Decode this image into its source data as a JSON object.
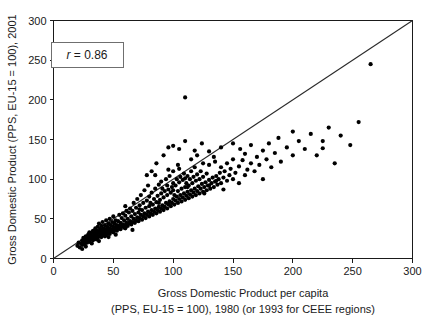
{
  "chart_data": {
    "type": "scatter",
    "title": "",
    "xlabel": "Gross Domestic Product per capita",
    "xlabel_line2": "(PPS, EU-15 = 100), 1980 (or 1993 for CEEE regions)",
    "ylabel": "Gross Domestic Product (PPS, EU-15 = 100), 2001",
    "xlim": [
      0,
      300
    ],
    "ylim": [
      0,
      300
    ],
    "xticks": [
      0,
      50,
      100,
      150,
      200,
      250,
      300
    ],
    "yticks": [
      0,
      50,
      100,
      150,
      200,
      250,
      300
    ],
    "xtick_labels": [
      "0",
      "50",
      "100",
      "150",
      "200",
      "250",
      "300"
    ],
    "ytick_labels": [
      "0",
      "50",
      "100",
      "150",
      "200",
      "250",
      "300"
    ],
    "grid": false,
    "legend_position": "none",
    "annotations": [
      {
        "name": "correlation-box",
        "symbol": "r",
        "operator": " = ",
        "value": "0.86",
        "text": "r = 0.86",
        "x": 28,
        "y": 257
      }
    ],
    "reference_line": {
      "name": "identity-line",
      "description": "45 degree y = x line",
      "x0": 0,
      "y0": 0,
      "x1": 300,
      "y1": 300
    },
    "marker": {
      "shape": "circle",
      "color": "#000000",
      "size_px": 2.1
    },
    "points": [
      [
        20,
        16
      ],
      [
        21,
        20
      ],
      [
        22,
        14
      ],
      [
        23,
        19
      ],
      [
        24,
        23
      ],
      [
        24,
        17
      ],
      [
        25,
        21
      ],
      [
        25,
        26
      ],
      [
        26,
        18
      ],
      [
        26,
        24
      ],
      [
        27,
        22
      ],
      [
        27,
        28
      ],
      [
        28,
        20
      ],
      [
        28,
        25
      ],
      [
        29,
        23
      ],
      [
        29,
        30
      ],
      [
        30,
        21
      ],
      [
        30,
        27
      ],
      [
        30,
        33
      ],
      [
        31,
        24
      ],
      [
        31,
        29
      ],
      [
        32,
        26
      ],
      [
        32,
        32
      ],
      [
        33,
        23
      ],
      [
        33,
        28
      ],
      [
        33,
        35
      ],
      [
        34,
        25
      ],
      [
        34,
        31
      ],
      [
        35,
        27
      ],
      [
        35,
        33
      ],
      [
        35,
        38
      ],
      [
        36,
        24
      ],
      [
        36,
        29
      ],
      [
        36,
        35
      ],
      [
        37,
        26
      ],
      [
        37,
        32
      ],
      [
        37,
        40
      ],
      [
        38,
        28
      ],
      [
        38,
        34
      ],
      [
        38,
        44
      ],
      [
        39,
        30
      ],
      [
        39,
        37
      ],
      [
        40,
        27
      ],
      [
        40,
        33
      ],
      [
        40,
        41
      ],
      [
        41,
        29
      ],
      [
        41,
        36
      ],
      [
        41,
        46
      ],
      [
        42,
        31
      ],
      [
        42,
        38
      ],
      [
        43,
        28
      ],
      [
        43,
        34
      ],
      [
        43,
        42
      ],
      [
        44,
        30
      ],
      [
        44,
        37
      ],
      [
        44,
        48
      ],
      [
        45,
        32
      ],
      [
        45,
        40
      ],
      [
        46,
        35
      ],
      [
        46,
        44
      ],
      [
        47,
        31
      ],
      [
        47,
        38
      ],
      [
        47,
        50
      ],
      [
        48,
        34
      ],
      [
        48,
        42
      ],
      [
        49,
        37
      ],
      [
        49,
        46
      ],
      [
        50,
        33
      ],
      [
        50,
        40
      ],
      [
        50,
        53
      ],
      [
        51,
        36
      ],
      [
        51,
        44
      ],
      [
        52,
        39
      ],
      [
        52,
        48
      ],
      [
        53,
        35
      ],
      [
        53,
        42
      ],
      [
        54,
        38
      ],
      [
        54,
        47
      ],
      [
        55,
        41
      ],
      [
        55,
        55
      ],
      [
        56,
        37
      ],
      [
        56,
        45
      ],
      [
        57,
        40
      ],
      [
        57,
        51
      ],
      [
        58,
        43
      ],
      [
        58,
        57
      ],
      [
        59,
        39
      ],
      [
        59,
        48
      ],
      [
        60,
        42
      ],
      [
        60,
        54
      ],
      [
        60,
        66
      ],
      [
        61,
        45
      ],
      [
        61,
        60
      ],
      [
        62,
        41
      ],
      [
        62,
        50
      ],
      [
        63,
        44
      ],
      [
        63,
        58
      ],
      [
        64,
        47
      ],
      [
        64,
        63
      ],
      [
        65,
        43
      ],
      [
        65,
        53
      ],
      [
        66,
        46
      ],
      [
        66,
        60
      ],
      [
        67,
        50
      ],
      [
        67,
        70
      ],
      [
        68,
        45
      ],
      [
        68,
        56
      ],
      [
        69,
        48
      ],
      [
        69,
        64
      ],
      [
        70,
        52
      ],
      [
        70,
        75
      ],
      [
        71,
        47
      ],
      [
        71,
        58
      ],
      [
        72,
        51
      ],
      [
        72,
        67
      ],
      [
        73,
        55
      ],
      [
        73,
        80
      ],
      [
        74,
        49
      ],
      [
        74,
        61
      ],
      [
        75,
        53
      ],
      [
        75,
        70
      ],
      [
        76,
        57
      ],
      [
        76,
        86
      ],
      [
        77,
        51
      ],
      [
        77,
        64
      ],
      [
        78,
        55
      ],
      [
        78,
        73
      ],
      [
        79,
        59
      ],
      [
        79,
        92
      ],
      [
        80,
        53
      ],
      [
        80,
        66
      ],
      [
        80,
        78
      ],
      [
        81,
        57
      ],
      [
        81,
        70
      ],
      [
        82,
        61
      ],
      [
        82,
        83
      ],
      [
        83,
        55
      ],
      [
        83,
        68
      ],
      [
        84,
        59
      ],
      [
        84,
        75
      ],
      [
        85,
        63
      ],
      [
        85,
        88
      ],
      [
        85,
        105
      ],
      [
        86,
        57
      ],
      [
        86,
        71
      ],
      [
        87,
        61
      ],
      [
        87,
        79
      ],
      [
        88,
        65
      ],
      [
        88,
        93
      ],
      [
        89,
        59
      ],
      [
        89,
        74
      ],
      [
        90,
        63
      ],
      [
        90,
        82
      ],
      [
        90,
        97
      ],
      [
        91,
        67
      ],
      [
        91,
        88
      ],
      [
        92,
        61
      ],
      [
        92,
        77
      ],
      [
        93,
        65
      ],
      [
        93,
        85
      ],
      [
        94,
        70
      ],
      [
        94,
        100
      ],
      [
        95,
        63
      ],
      [
        95,
        80
      ],
      [
        95,
        92
      ],
      [
        96,
        68
      ],
      [
        96,
        87
      ],
      [
        97,
        72
      ],
      [
        97,
        104
      ],
      [
        98,
        66
      ],
      [
        98,
        83
      ],
      [
        99,
        70
      ],
      [
        99,
        90
      ],
      [
        100,
        75
      ],
      [
        100,
        95
      ],
      [
        100,
        110
      ],
      [
        100,
        86
      ],
      [
        101,
        68
      ],
      [
        101,
        80
      ],
      [
        102,
        73
      ],
      [
        102,
        92
      ],
      [
        103,
        78
      ],
      [
        103,
        100
      ],
      [
        104,
        70
      ],
      [
        104,
        85
      ],
      [
        105,
        75
      ],
      [
        105,
        96
      ],
      [
        105,
        113
      ],
      [
        106,
        80
      ],
      [
        106,
        103
      ],
      [
        107,
        72
      ],
      [
        107,
        88
      ],
      [
        108,
        77
      ],
      [
        108,
        99
      ],
      [
        109,
        82
      ],
      [
        109,
        107
      ],
      [
        110,
        74
      ],
      [
        110,
        90
      ],
      [
        110,
        101
      ],
      [
        110,
        203
      ],
      [
        111,
        79
      ],
      [
        111,
        95
      ],
      [
        112,
        84
      ],
      [
        112,
        104
      ],
      [
        113,
        76
      ],
      [
        113,
        92
      ],
      [
        114,
        81
      ],
      [
        114,
        100
      ],
      [
        115,
        86
      ],
      [
        115,
        110
      ],
      [
        115,
        125
      ],
      [
        116,
        78
      ],
      [
        116,
        95
      ],
      [
        117,
        83
      ],
      [
        117,
        103
      ],
      [
        118,
        88
      ],
      [
        118,
        115
      ],
      [
        119,
        80
      ],
      [
        119,
        98
      ],
      [
        120,
        85
      ],
      [
        120,
        106
      ],
      [
        120,
        130
      ],
      [
        121,
        91
      ],
      [
        122,
        82
      ],
      [
        122,
        100
      ],
      [
        123,
        88
      ],
      [
        123,
        110
      ],
      [
        124,
        94
      ],
      [
        125,
        84
      ],
      [
        125,
        103
      ],
      [
        125,
        120
      ],
      [
        126,
        90
      ],
      [
        127,
        96
      ],
      [
        128,
        86
      ],
      [
        128,
        107
      ],
      [
        129,
        92
      ],
      [
        130,
        99
      ],
      [
        130,
        118
      ],
      [
        130,
        135
      ],
      [
        131,
        88
      ],
      [
        132,
        95
      ],
      [
        133,
        102
      ],
      [
        134,
        90
      ],
      [
        135,
        97
      ],
      [
        135,
        122
      ],
      [
        136,
        104
      ],
      [
        137,
        93
      ],
      [
        138,
        100
      ],
      [
        139,
        108
      ],
      [
        140,
        95
      ],
      [
        140,
        115
      ],
      [
        140,
        140
      ],
      [
        142,
        102
      ],
      [
        143,
        110
      ],
      [
        145,
        98
      ],
      [
        145,
        120
      ],
      [
        147,
        105
      ],
      [
        148,
        113
      ],
      [
        150,
        100
      ],
      [
        150,
        125
      ],
      [
        150,
        145
      ],
      [
        152,
        108
      ],
      [
        155,
        116
      ],
      [
        155,
        95
      ],
      [
        158,
        124
      ],
      [
        160,
        105
      ],
      [
        160,
        132
      ],
      [
        162,
        112
      ],
      [
        165,
        120
      ],
      [
        165,
        143
      ],
      [
        168,
        110
      ],
      [
        170,
        128
      ],
      [
        172,
        118
      ],
      [
        175,
        136
      ],
      [
        175,
        100
      ],
      [
        178,
        125
      ],
      [
        180,
        145
      ],
      [
        182,
        115
      ],
      [
        185,
        133
      ],
      [
        188,
        152
      ],
      [
        190,
        122
      ],
      [
        195,
        140
      ],
      [
        200,
        130
      ],
      [
        200,
        160
      ],
      [
        205,
        148
      ],
      [
        210,
        138
      ],
      [
        215,
        157
      ],
      [
        220,
        130
      ],
      [
        225,
        148
      ],
      [
        230,
        165
      ],
      [
        235,
        120
      ],
      [
        240,
        155
      ],
      [
        248,
        143
      ],
      [
        255,
        172
      ],
      [
        265,
        245
      ],
      [
        225,
        139
      ],
      [
        60,
        38
      ],
      [
        72,
        62
      ],
      [
        88,
        70
      ],
      [
        96,
        112
      ],
      [
        104,
        118
      ],
      [
        112,
        90
      ],
      [
        126,
        82
      ],
      [
        134,
        128
      ],
      [
        142,
        87
      ],
      [
        156,
        138
      ],
      [
        96,
        140
      ],
      [
        100,
        142
      ],
      [
        105,
        138
      ],
      [
        92,
        130
      ],
      [
        86,
        120
      ],
      [
        118,
        136
      ],
      [
        124,
        145
      ],
      [
        110,
        148
      ],
      [
        82,
        110
      ],
      [
        78,
        105
      ],
      [
        130,
        92
      ],
      [
        136,
        98
      ],
      [
        66,
        36
      ],
      [
        52,
        30
      ],
      [
        46,
        27
      ],
      [
        38,
        22
      ],
      [
        32,
        19
      ],
      [
        27,
        15
      ],
      [
        24,
        12
      ]
    ]
  }
}
